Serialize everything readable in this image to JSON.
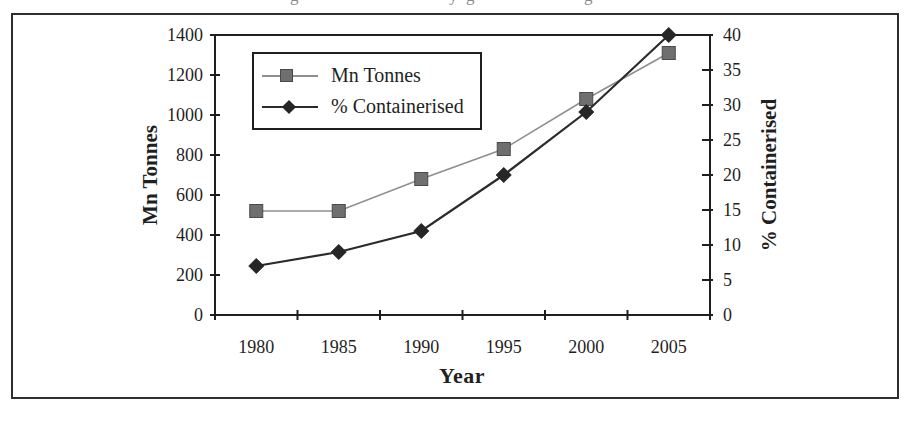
{
  "page": {
    "background": "#ffffff"
  },
  "cropped_caption": {
    "fragments": [
      {
        "char": "g"
      },
      {
        "char": "y"
      },
      {
        "char": "g"
      },
      {
        "char": "g"
      }
    ]
  },
  "colors": {
    "frame_border": "#2e2e2e",
    "axis": "#1f1f1f",
    "text": "#1f1f1f",
    "mn_tonnes_line": "#8f8f8f",
    "mn_tonnes_marker": "#6f6f6f",
    "mn_tonnes_marker_edge": "#4a4a4a",
    "containerised_line": "#2b2b2b",
    "containerised_marker": "#262626"
  },
  "chart_data": {
    "type": "line",
    "title": "",
    "categories": [
      "1980",
      "1985",
      "1990",
      "1995",
      "2000",
      "2005"
    ],
    "series": [
      {
        "name": "Mn Tonnes",
        "axis": "left",
        "marker": "square",
        "values": [
          520,
          520,
          680,
          830,
          1080,
          1310
        ]
      },
      {
        "name": "% Containerised",
        "axis": "right",
        "marker": "diamond",
        "values": [
          7,
          9,
          12,
          20,
          29,
          40
        ]
      }
    ],
    "x_axis": {
      "label": "Year"
    },
    "left_axis": {
      "label": "Mn Tonnes",
      "range": [
        0,
        1400
      ],
      "ticks": [
        0,
        200,
        400,
        600,
        800,
        1000,
        1200,
        1400
      ]
    },
    "right_axis": {
      "label": "% Containerised",
      "range": [
        0,
        40
      ],
      "ticks": [
        0,
        5,
        10,
        15,
        20,
        25,
        30,
        35,
        40
      ]
    },
    "legend": {
      "position": "top-left-inside"
    },
    "grid": false
  }
}
